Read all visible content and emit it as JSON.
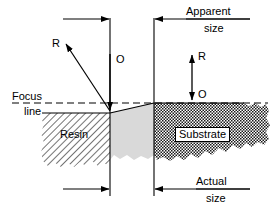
{
  "figure": {
    "type": "technical-cross-section-diagram",
    "colors": {
      "line": "#000000",
      "resin_hatch": "#000000",
      "resin_fill": "#ffffff",
      "transition_fill": "#d9d9d9",
      "substrate_fill": "#3a3a3a",
      "background": "#ffffff"
    },
    "labels": {
      "focus_line_1": "Focus",
      "focus_line_2": "line",
      "resin": "Resin",
      "substrate": "Substrate",
      "apparent_1": "Apparent",
      "apparent_2": "size",
      "actual_1": "Actual",
      "actual_2": "size",
      "ray_left": "R",
      "optic_left": "O",
      "ray_right": "R",
      "optic_right": "O"
    },
    "annotations": {
      "apparent_size_description": "Horizontal dimension arrow at top spanning from left reference line rightwards, and from right reference line rightwards, labeled Apparent size",
      "actual_size_description": "Horizontal dimension arrow at bottom spanning from left reference line rightwards, and from right reference line rightwards, labeled Actual size",
      "focus_line_description": "Horizontal dashed line across the figure marking the focus plane",
      "ray_left_description": "Diagonal arrow pointing up-left from the resin surface labeled R",
      "optic_left_description": "Vertical arrow pointing down to the resin surface labeled O",
      "right_double_arrow_description": "Vertical double headed arrow above the substrate labeled R at top and O at bottom"
    },
    "materials": [
      {
        "name": "Resin",
        "pattern": "diagonal-hatch",
        "side": "left"
      },
      {
        "name": "Transition",
        "pattern": "solid-gray",
        "side": "center"
      },
      {
        "name": "Substrate",
        "pattern": "checkerboard-dark",
        "side": "right"
      }
    ]
  }
}
